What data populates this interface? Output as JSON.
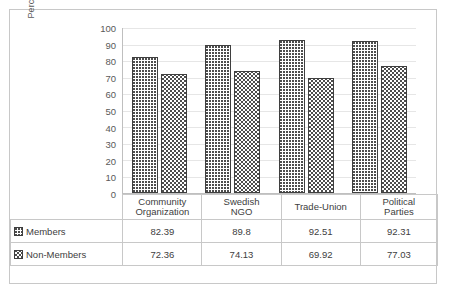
{
  "chart_data": {
    "type": "bar",
    "title": "",
    "xlabel": "",
    "ylabel": "Percentage",
    "ylim": [
      0,
      100
    ],
    "yticks": [
      0,
      10,
      20,
      30,
      40,
      50,
      60,
      70,
      80,
      90,
      100
    ],
    "grid": true,
    "legend_position": "table-below",
    "categories": [
      {
        "line1": "Community",
        "line2": "Organization"
      },
      {
        "line1": "Swedish",
        "line2": "NGO"
      },
      {
        "line1": "Trade-Union",
        "line2": ""
      },
      {
        "line1": "Political",
        "line2": "Parties"
      }
    ],
    "series": [
      {
        "name": "Members",
        "values": [
          82.39,
          89.8,
          92.51,
          92.31
        ]
      },
      {
        "name": "Non-Members",
        "values": [
          72.36,
          74.13,
          69.92,
          77.03
        ]
      }
    ]
  },
  "table": {
    "rows": [
      {
        "label": "Members",
        "swatch": "dotted-pattern-swatch",
        "values": [
          "82.39",
          "89.8",
          "92.51",
          "92.31"
        ]
      },
      {
        "label": "Non-Members",
        "swatch": "zigzag-pattern-swatch",
        "values": [
          "72.36",
          "74.13",
          "69.92",
          "77.03"
        ]
      }
    ]
  }
}
